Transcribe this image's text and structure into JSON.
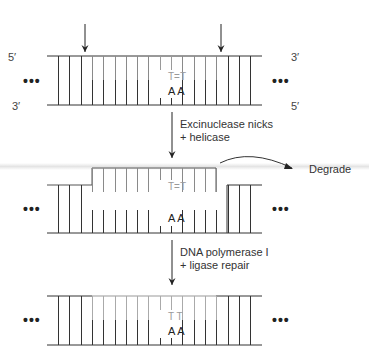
{
  "diagram": {
    "colors": {
      "strand": "#333333",
      "old_rung": "#333333",
      "excised_rung": "#8a8a8a",
      "new_rung_top": "#aaaaaa",
      "dimer_text": "#9a9a9a",
      "base_text": "#222222"
    },
    "panel1": {
      "top_left_end": "5′",
      "bottom_left_end": "3′",
      "top_right_end": "3′",
      "bottom_right_end": "5′",
      "left_dots": "•••",
      "right_dots": "•••",
      "dimer_label": "T=T",
      "partner_label": "A A",
      "cut_arrows": [
        "left-nick-site",
        "right-nick-site"
      ]
    },
    "step1": {
      "line1": "Excinuclease nicks",
      "line2": "+ helicase"
    },
    "panel2": {
      "left_dots": "•••",
      "right_dots": "•••",
      "dimer_label": "T=T",
      "partner_label": "A A",
      "degrade_label": "Degrade"
    },
    "step2": {
      "line1": "DNA polymerase I",
      "line2": "+ ligase repair"
    },
    "panel3": {
      "left_dots": "•••",
      "right_dots": "•••",
      "repaired_label": "T T",
      "partner_label": "A A"
    },
    "rung_count": 18,
    "excised_range": [
      3,
      14
    ],
    "dimer_positions": [
      9,
      10
    ]
  }
}
